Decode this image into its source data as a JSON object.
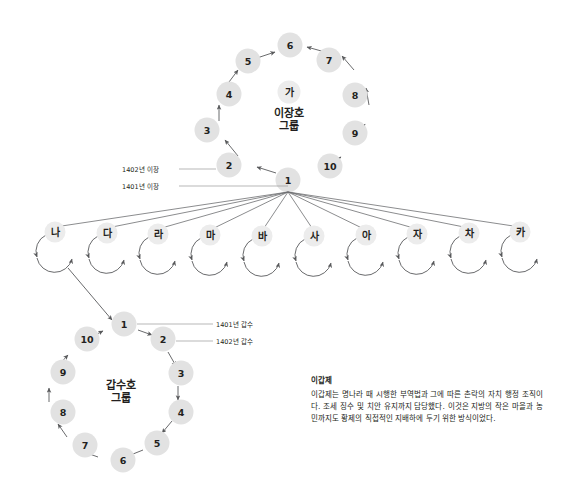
{
  "diagram": {
    "type": "organizational-network-diagram",
    "background": "#ffffff",
    "node_fill": "#e2e2e2",
    "edge_color": "#58595b",
    "text_color": "#231f20",
    "top_group": {
      "name": "이장호",
      "title_line1": "이장호",
      "title_line2": "그룹",
      "center_badge": "가",
      "direction": "counterclockwise",
      "nodes": [
        "1",
        "2",
        "3",
        "4",
        "5",
        "6",
        "7",
        "8",
        "9",
        "10"
      ]
    },
    "bottom_group": {
      "name": "갑수호",
      "title_line1": "갑수호",
      "title_line2": "그룹",
      "direction": "clockwise",
      "nodes": [
        "1",
        "2",
        "3",
        "4",
        "5",
        "6",
        "7",
        "8",
        "9",
        "10"
      ]
    },
    "middle_row": {
      "nodes": [
        "나",
        "다",
        "라",
        "마",
        "바",
        "사",
        "아",
        "자",
        "차",
        "카"
      ]
    },
    "annotations": {
      "top_upper": "1402년 이장",
      "top_lower": "1401년 이장",
      "bottom_upper": "1401년 갑수",
      "bottom_lower": "1402년 갑수"
    }
  },
  "note": {
    "title": "이갑제",
    "body": "이갑제는 명나라 때 시행한 부역법과 그에 따른 촌락의 자치 행정 조직이다. 조세 징수 및 치안 유지까지 담당했다. 이것은 지방의 작은 마을과 농민까지도 황제의 직접적인 지배하에 두기 위한 방식이었다."
  }
}
